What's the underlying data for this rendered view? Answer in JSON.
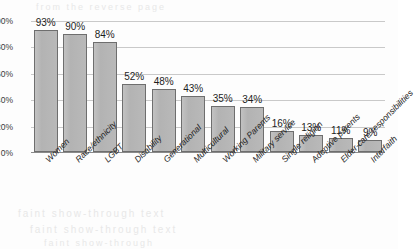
{
  "chart_data": {
    "type": "bar",
    "title": "",
    "subtitle": "",
    "xlabel": "",
    "ylabel": "",
    "ylim": [
      0,
      100
    ],
    "yticks": [
      "0%",
      "20%",
      "40%",
      "60%",
      "80%",
      "100%"
    ],
    "ytick_values": [
      0,
      20,
      40,
      60,
      80,
      100
    ],
    "grid": "horizontal",
    "legend": "none",
    "orientation": "vertical",
    "categories": [
      "Women",
      "Race/ethnicity",
      "LGBT",
      "Disability",
      "Generational",
      "Multicultural",
      "Working Parents",
      "Military service",
      "Single religion",
      "Adoptive parents",
      "Elder-care responsibilities",
      "Interfaith"
    ],
    "values": [
      93,
      90,
      84,
      52,
      48,
      43,
      35,
      34,
      16,
      13,
      11,
      9
    ],
    "data_labels": [
      "93%",
      "90%",
      "84%",
      "52%",
      "48%",
      "43%",
      "35%",
      "34%",
      "16%",
      "13%",
      "11%",
      "9%"
    ],
    "colors": {
      "bar_fill": "#b8b8b8",
      "bar_border": "#6e6e6e",
      "gridline": "#c9c9c9",
      "axis": "#8a8a8a",
      "text": "#222222",
      "background": "#fdfdfd"
    }
  },
  "artifacts": {
    "bleed_top": "from the reverse page",
    "bleed_mid": "faint show-through text",
    "bleed_low": "faint show-through text",
    "bleed_bottom": "faint show-through"
  }
}
